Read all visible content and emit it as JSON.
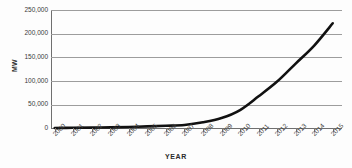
{
  "chart_data": {
    "type": "line",
    "title": "",
    "xlabel": "YEAR",
    "ylabel": "MW",
    "categories": [
      "2000",
      "2001",
      "2002",
      "2003",
      "2004",
      "2005",
      "2006",
      "2007",
      "2008",
      "2009",
      "2010",
      "2011",
      "2012",
      "2013",
      "2014",
      "2015"
    ],
    "series": [
      {
        "name": "Installed capacity",
        "values": [
          1200,
          1500,
          1900,
          2400,
          3200,
          4400,
          5800,
          7500,
          13000,
          22000,
          39000,
          68000,
          99000,
          137000,
          175000,
          222000
        ]
      }
    ],
    "ylim": [
      0,
      250000
    ],
    "ytick_labels": [
      "0",
      "50,000",
      "100,000",
      "150,000",
      "200,000",
      "250,000"
    ],
    "ytick_values": [
      0,
      50000,
      100000,
      150000,
      200000,
      250000
    ],
    "grid": true,
    "legend": "none",
    "line_color": "#111111",
    "grid_color": "#9d9d9d",
    "axis_color": "#6f6f6f",
    "background_color": "#fdfdfd"
  },
  "axis": {
    "y_title": "MW",
    "x_title": "YEAR"
  }
}
